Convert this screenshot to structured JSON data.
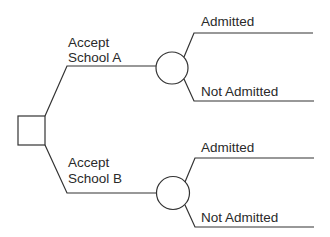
{
  "diagram": {
    "type": "decision-tree",
    "decision_node": {
      "shape": "square"
    },
    "branches": [
      {
        "label_line1": "Accept",
        "label_line2": "School A",
        "chance_node": {
          "shape": "circle"
        },
        "outcomes": [
          {
            "label": "Admitted"
          },
          {
            "label": "Not Admitted"
          }
        ]
      },
      {
        "label_line1": "Accept",
        "label_line2": "School B",
        "chance_node": {
          "shape": "circle"
        },
        "outcomes": [
          {
            "label": "Admitted"
          },
          {
            "label": "Not Admitted"
          }
        ]
      }
    ],
    "colors": {
      "line": "#333333",
      "text": "#2a2a2a",
      "background": "#ffffff"
    }
  }
}
